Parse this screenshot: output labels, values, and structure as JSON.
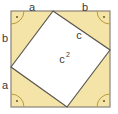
{
  "figure": {
    "name": "pythagorean-theorem-square-diagram",
    "colors": {
      "outer_square_fill": "#F5E4A8",
      "outer_square_stroke": "#8A8377",
      "inner_square_fill": "#FFFFFF",
      "inner_square_stroke": "#5C5750",
      "right_angle_marker_stroke": "#B99C3C",
      "label_color": "#3A3A38",
      "background": "#FFFFFF"
    },
    "outer_square": {
      "left": 11,
      "top": 11,
      "right": 110,
      "bottom": 107
    },
    "inner_square_vertices": [
      {
        "name": "top-vertex",
        "x": 53,
        "y": 11
      },
      {
        "name": "right-vertex",
        "x": 110,
        "y": 50
      },
      {
        "name": "bottom-vertex",
        "x": 67,
        "y": 107
      },
      {
        "name": "left-vertex",
        "x": 11,
        "y": 67
      }
    ],
    "labels": {
      "top_left_side": "a",
      "top_right_side": "b",
      "left_upper_side": "b",
      "left_lower_side": "a",
      "hypotenuse": "c",
      "inner_area_base": "c",
      "inner_area_exponent": "2"
    },
    "right_angle_markers": [
      {
        "name": "right-angle-marker-top-left",
        "cx": 11,
        "cy": 11,
        "dot_x": 18,
        "dot_y": 18
      },
      {
        "name": "right-angle-marker-top-right",
        "cx": 110,
        "cy": 11,
        "dot_x": 103,
        "dot_y": 18
      },
      {
        "name": "right-angle-marker-bottom-right",
        "cx": 110,
        "cy": 107,
        "dot_x": 103,
        "dot_y": 100
      },
      {
        "name": "right-angle-marker-bottom-left",
        "cx": 11,
        "cy": 107,
        "dot_x": 18,
        "dot_y": 100
      }
    ]
  }
}
